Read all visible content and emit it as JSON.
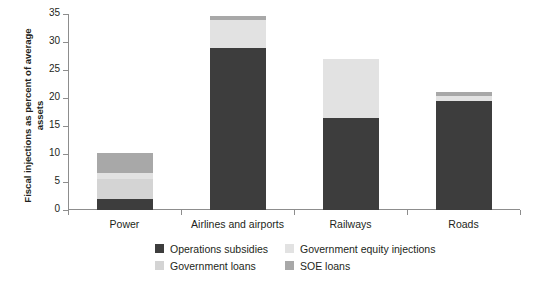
{
  "chart_data": {
    "type": "bar",
    "subtype": "stacked-bar",
    "title": "",
    "xlabel": "",
    "ylabel": "Fiscal injections as percent of average assets",
    "ylim": [
      0,
      35
    ],
    "yticks": [
      0,
      5,
      10,
      15,
      20,
      25,
      30,
      35
    ],
    "ytick_labels": [
      "0",
      "5",
      "10",
      "15",
      "20",
      "25",
      "30",
      "35"
    ],
    "grid": false,
    "legend_position": "bottom",
    "categories": [
      "Power",
      "Airlines and airports",
      "Railways",
      "Roads"
    ],
    "series": [
      {
        "name": "Operations subsidies",
        "color": "#3d3d3d",
        "values": [
          1.9,
          28.9,
          16.5,
          19.4
        ]
      },
      {
        "name": "Government loans",
        "color": "#d4d4d4",
        "values": [
          3.7,
          0.0,
          0.0,
          0.0
        ]
      },
      {
        "name": "Government equity injections",
        "color": "#e2e2e2",
        "values": [
          1.0,
          5.1,
          10.4,
          1.0
        ]
      },
      {
        "name": "SOE loans",
        "color": "#a8a8a8",
        "values": [
          3.6,
          0.6,
          0.0,
          0.6
        ]
      }
    ],
    "totals": [
      10.2,
      34.6,
      26.9,
      21.0
    ]
  },
  "legend": {
    "entries": [
      {
        "label": "Operations subsidies",
        "color": "#3d3d3d"
      },
      {
        "label": "Government equity injections",
        "color": "#e2e2e2"
      },
      {
        "label": "Government loans",
        "color": "#d4d4d4"
      },
      {
        "label": "SOE loans",
        "color": "#a8a8a8"
      }
    ]
  },
  "axis": {
    "y_title": "Fiscal injections as percent of average assets",
    "axis_color": "#8d8d8d"
  }
}
